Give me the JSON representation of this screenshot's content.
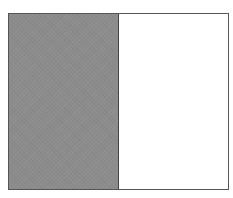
{
  "diagram": {
    "type": "partitioned-rectangle",
    "parts_total": 2,
    "parts_shaded": 1,
    "parts": [
      {
        "index": 0,
        "state": "shaded",
        "fill": "#8c8c8c"
      },
      {
        "index": 1,
        "state": "unshaded",
        "fill": "#ffffff"
      }
    ],
    "border_color": "#555555"
  }
}
